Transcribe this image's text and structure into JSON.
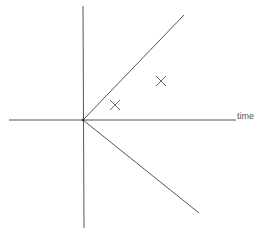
{
  "diagram": {
    "colors": {
      "background": "#ffffff",
      "line": "#555555",
      "marker": "#666666",
      "label": "#555555"
    },
    "origin": {
      "x": 83,
      "y": 120
    },
    "horizontal_axis": {
      "x1": 9,
      "y1": 120,
      "x2": 236,
      "y2": 120,
      "label": "time"
    },
    "vertical_axis": {
      "x1": 83,
      "y1": 6,
      "x2": 84,
      "y2": 228
    },
    "upper_ray": {
      "x1": 83,
      "y1": 120,
      "x2": 184,
      "y2": 15
    },
    "lower_ray": {
      "x1": 83,
      "y1": 120,
      "x2": 199,
      "y2": 213
    },
    "markers": [
      {
        "symbol": "×",
        "x": 115,
        "y": 105
      },
      {
        "symbol": "×",
        "x": 161,
        "y": 81
      }
    ]
  }
}
